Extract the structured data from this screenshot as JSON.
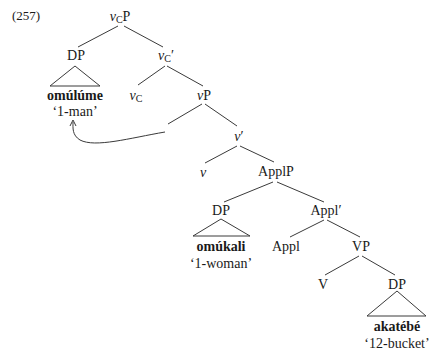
{
  "example_number": "(257)",
  "nodes": {
    "vCP": {
      "head": "v",
      "sub": "C",
      "tail": "P"
    },
    "DP_subject": "DP",
    "vCbar": {
      "head": "v",
      "sub": "C",
      "tail": "′"
    },
    "subject_word": "omúlúme",
    "subject_gloss": "‘1-man’",
    "vC": {
      "head": "v",
      "sub": "C"
    },
    "vP": {
      "head": "v",
      "tail": "P"
    },
    "vbar": {
      "head": "v",
      "tail": "′"
    },
    "v": "v",
    "ApplP": "ApplP",
    "DP_applied": "DP",
    "Applbar": "Appl′",
    "applied_word": "omúkali",
    "applied_gloss": "‘1-woman’",
    "Appl": "Appl",
    "VP": "VP",
    "V": "V",
    "DP_object": "DP",
    "object_word": "akatébé",
    "object_gloss": "‘12-bucket’"
  },
  "arrow": {
    "from": "vP-specifier",
    "to": "omúlúme",
    "label": "movement-arrow"
  },
  "colors": {
    "line": "#3a3a3a",
    "text": "#1a1a1a",
    "background": "#ffffff"
  }
}
